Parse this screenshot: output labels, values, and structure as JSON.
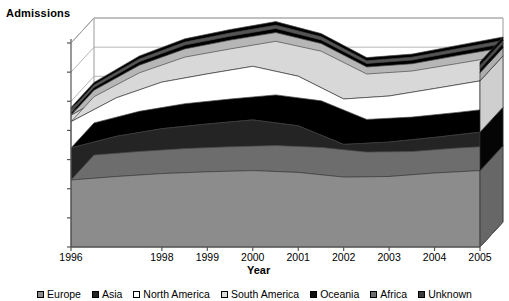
{
  "chart_data": {
    "type": "area",
    "subtype": "3d-stacked-area",
    "title": "",
    "ylabel": "Admissions",
    "xlabel": "Year",
    "categories": [
      "1996",
      "1997",
      "1998",
      "1999",
      "2000",
      "2001",
      "2002",
      "2003",
      "2004",
      "2005"
    ],
    "tick_labels": [
      "1996",
      "1998",
      "1999",
      "2000",
      "2001",
      "2002",
      "2003",
      "2004",
      "2005"
    ],
    "ylim": [
      0,
      35000000
    ],
    "ytick_labels": [
      "35,000,000",
      "30,000,000",
      "25,000,000",
      "20,000,000",
      "15,000,000",
      "10,000,000",
      "5,000,000",
      "0"
    ],
    "yticks": [
      35000000,
      30000000,
      25000000,
      20000000,
      15000000,
      10000000,
      5000000,
      0
    ],
    "grid": true,
    "legend_position": "bottom",
    "series": [
      {
        "name": "Europe",
        "color": "#8c8c8c",
        "values": [
          11500000,
          12100000,
          12600000,
          12900000,
          13100000,
          12800000,
          12000000,
          12100000,
          12700000,
          13100000
        ]
      },
      {
        "name": "Asia",
        "color": "#242424",
        "values": [
          5500000,
          6900000,
          7700000,
          8200000,
          8700000,
          8000000,
          5600000,
          5900000,
          6100000,
          6600000
        ]
      },
      {
        "name": "North America",
        "color": "#ffffff",
        "values": [
          4500000,
          6600000,
          8000000,
          8600000,
          9200000,
          8500000,
          7800000,
          7900000,
          8400000,
          8800000
        ]
      },
      {
        "name": "South America",
        "color": "#dcdcdc",
        "values": [
          1100000,
          1300000,
          1400000,
          1500000,
          1500000,
          1300000,
          1200000,
          1250000,
          1350000,
          1400000
        ]
      },
      {
        "name": "Oceania",
        "color": "#111111",
        "values": [
          500000,
          600000,
          650000,
          680000,
          700000,
          650000,
          600000,
          620000,
          650000,
          680000
        ]
      },
      {
        "name": "Africa",
        "color": "#6e6e6e",
        "values": [
          400000,
          480000,
          520000,
          550000,
          570000,
          520000,
          480000,
          500000,
          530000,
          560000
        ]
      },
      {
        "name": "Unknown",
        "color": "#3a3a3a",
        "values": [
          450000,
          520000,
          560000,
          590000,
          620000,
          560000,
          520000,
          540000,
          570000,
          600000
        ]
      }
    ]
  },
  "legend": {
    "items": [
      {
        "label": "Europe",
        "swatch": "europe-swatch"
      },
      {
        "label": "Asia",
        "swatch": "asia-swatch"
      },
      {
        "label": "North America",
        "swatch": "north-america-swatch"
      },
      {
        "label": "South America",
        "swatch": "south-america-swatch"
      },
      {
        "label": "Oceania",
        "swatch": "oceania-swatch"
      },
      {
        "label": "Africa",
        "swatch": "africa-swatch"
      },
      {
        "label": "Unknown",
        "swatch": "unknown-swatch"
      }
    ]
  }
}
